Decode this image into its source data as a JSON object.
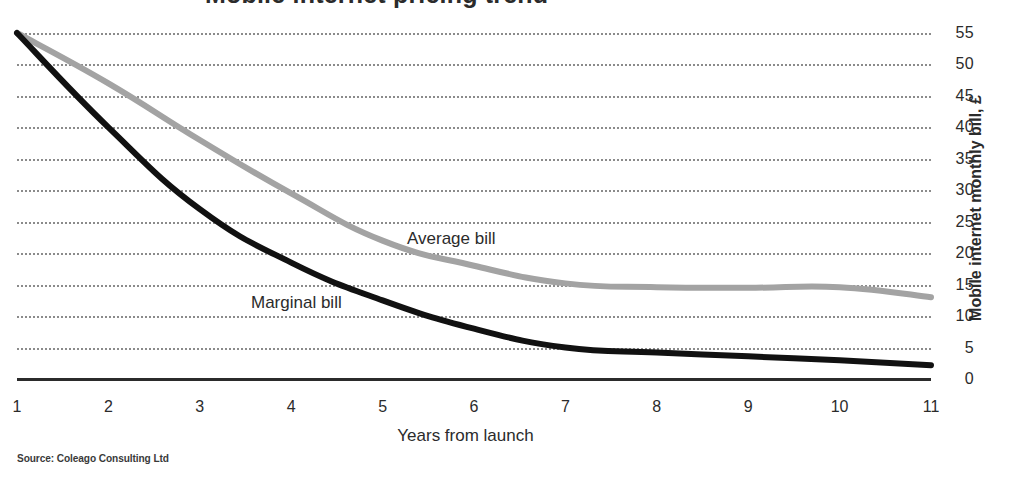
{
  "chart_data": {
    "type": "line",
    "title": "",
    "xlabel": "Years from launch",
    "ylabel": "Mobile internet monthly bill, £",
    "x": [
      1,
      2,
      3,
      4,
      5,
      6,
      7,
      8,
      9,
      10,
      11
    ],
    "xticklabels": [
      "1",
      "2",
      "3",
      "4",
      "5",
      "6",
      "7",
      "8",
      "9",
      "10",
      "11"
    ],
    "yticklabels": [
      "55",
      "50",
      "45",
      "40",
      "35",
      "30",
      "25",
      "20",
      "15",
      "10",
      "5",
      "0"
    ],
    "yticks": [
      55,
      50,
      45,
      40,
      35,
      30,
      25,
      20,
      15,
      10,
      5,
      0
    ],
    "ylim": [
      0,
      55
    ],
    "xlim": [
      1,
      11
    ],
    "grid": "horizontal-dotted",
    "legend": "inline-labels",
    "series": [
      {
        "name": "Average bill",
        "color": "#a3a3a3",
        "values": [
          55.0,
          47.0,
          38.0,
          29.5,
          22.0,
          18.0,
          15.2,
          14.6,
          14.5,
          14.6,
          13.0
        ]
      },
      {
        "name": "Marginal bill",
        "color": "#111111",
        "values": [
          55.0,
          40.0,
          27.0,
          18.5,
          12.5,
          8.0,
          5.0,
          4.2,
          3.6,
          3.0,
          2.2
        ]
      }
    ],
    "annotations": [
      {
        "text": "Average bill",
        "x": 5.0,
        "y": 23.5
      },
      {
        "text": "Marginal bill",
        "x": 3.3,
        "y": 13.2
      }
    ],
    "source": "Source: Coleago Consulting Ltd"
  },
  "axis": {
    "y_title": "Mobile internet monthly bill, £",
    "x_title": "Years from launch"
  },
  "labels": {
    "average": "Average bill",
    "marginal": "Marginal bill"
  },
  "footer": {
    "source": "Source: Coleago Consulting Ltd"
  },
  "title_strip": {
    "text": "Mobile internet pricing trend"
  }
}
